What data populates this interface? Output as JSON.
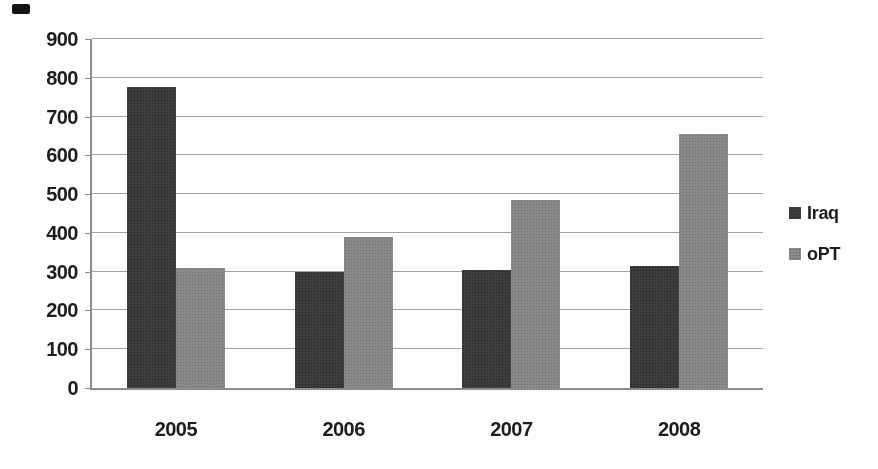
{
  "chart_data": {
    "type": "bar",
    "title": "",
    "xlabel": "",
    "ylabel": "",
    "categories": [
      "2005",
      "2006",
      "2007",
      "2008"
    ],
    "series": [
      {
        "name": "Iraq",
        "color": "#3d3d3d",
        "values": [
          775,
          300,
          305,
          315
        ]
      },
      {
        "name": "oPT",
        "color": "#8a8a8a",
        "values": [
          310,
          390,
          485,
          655
        ]
      }
    ],
    "ylim": [
      0,
      900
    ],
    "ytick_interval": 100,
    "yticks": [
      "0",
      "100",
      "200",
      "300",
      "400",
      "500",
      "600",
      "700",
      "800",
      "900"
    ],
    "grid": true,
    "legend_position": "right"
  },
  "colors": {
    "background": "#fdfdfb",
    "gridline": "#a2a2a2",
    "axis": "#8b8b8b",
    "text": "#1d1d1d"
  }
}
